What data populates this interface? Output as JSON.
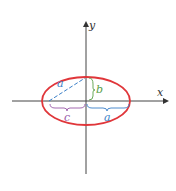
{
  "diagram": {
    "type": "ellipse-geometry",
    "axes": {
      "x_label": "x",
      "y_label": "y"
    },
    "labels": {
      "semi_major_hyp": "a",
      "semi_minor": "b",
      "focal_distance": "c",
      "semi_major": "a"
    },
    "colors": {
      "ellipse": "#e0363a",
      "axis": "#444444",
      "a": "#3a7fc8",
      "b": "#5aa048",
      "c": "#9a5aa8"
    }
  }
}
